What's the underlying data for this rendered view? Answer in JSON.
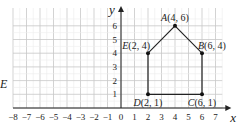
{
  "diagram": {
    "axes": {
      "x_label": "x",
      "y_label": "y",
      "x_ticks": [
        "-8",
        "-7",
        "-6",
        "-5",
        "-4",
        "-3",
        "-2",
        "-1",
        "0",
        "1",
        "2",
        "3",
        "4",
        "5",
        "6",
        "7"
      ],
      "y_ticks": [
        "1",
        "2",
        "3",
        "4",
        "5",
        "6"
      ],
      "x_range": [
        -8,
        7.5
      ],
      "y_range": [
        0,
        6.8
      ]
    },
    "points": [
      {
        "name": "A",
        "label": "A(4, 6)",
        "x": 4,
        "y": 6
      },
      {
        "name": "B",
        "label": "B(6, 4)",
        "x": 6,
        "y": 4
      },
      {
        "name": "C",
        "label": "C(6, 1)",
        "x": 6,
        "y": 1
      },
      {
        "name": "D",
        "label": "D(2, 1)",
        "x": 2,
        "y": 1
      },
      {
        "name": "E",
        "label": "E(2, 4)",
        "x": 2,
        "y": 4
      }
    ],
    "polygon_order": [
      "A",
      "B",
      "C",
      "D",
      "E"
    ],
    "stray_label": "E",
    "colors": {
      "grid": "#cfcfcf",
      "axis": "#222222",
      "shape": "#222222"
    }
  }
}
